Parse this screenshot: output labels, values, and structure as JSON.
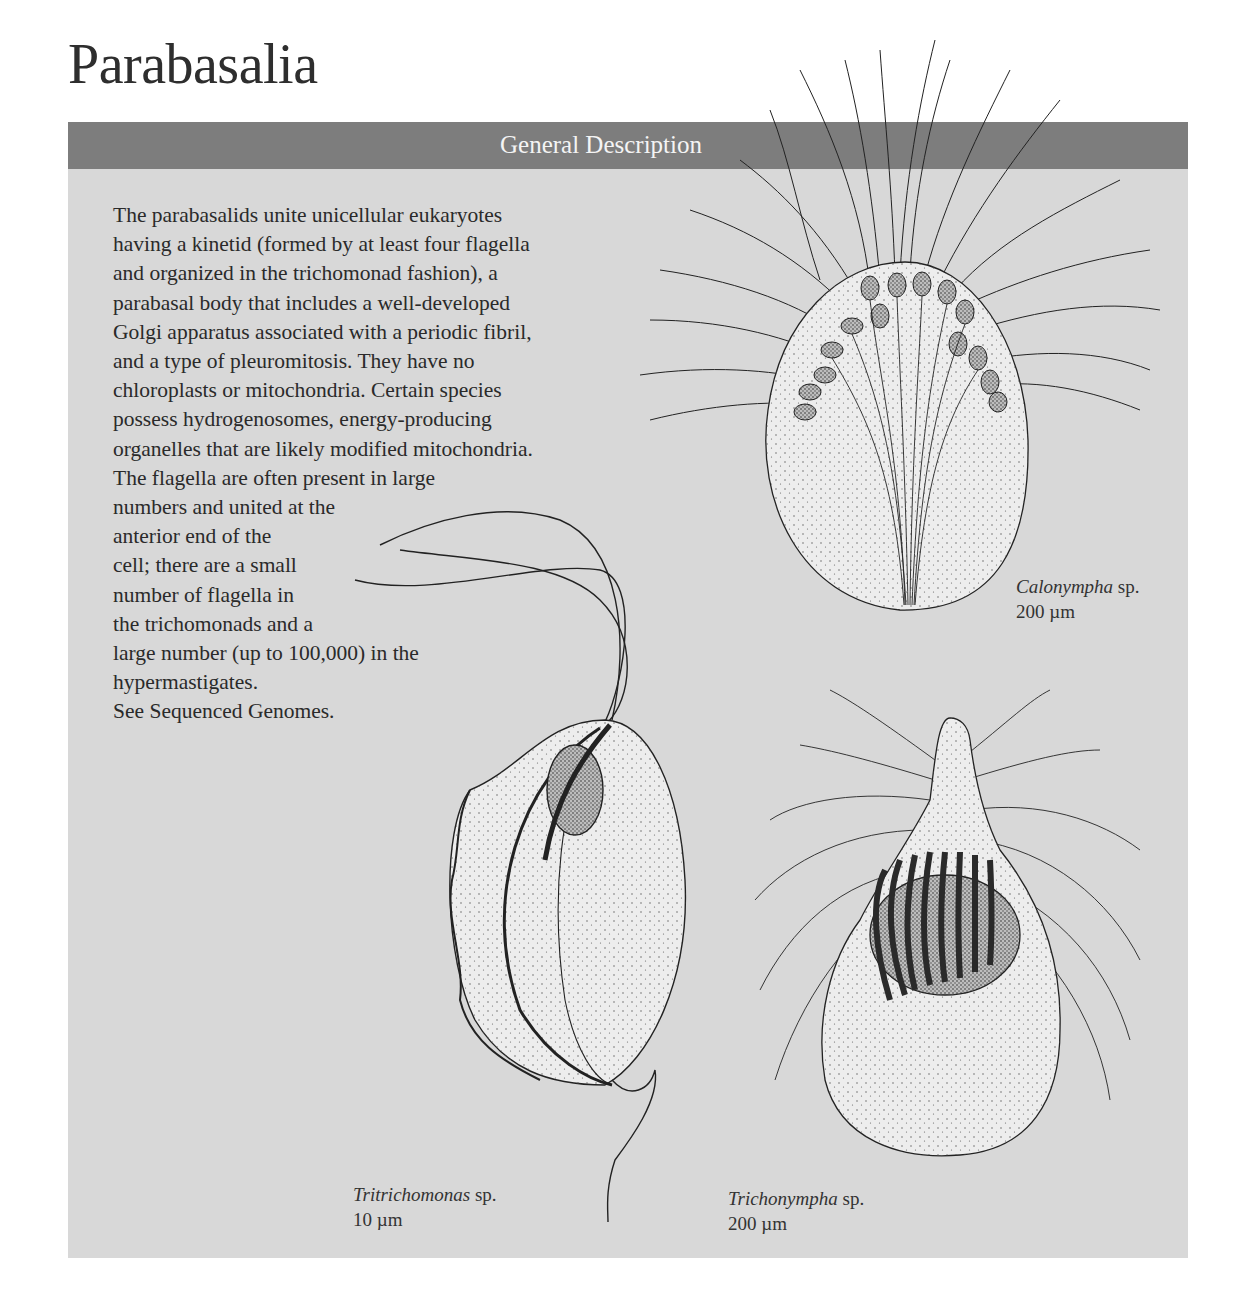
{
  "page": {
    "title": "Parabasalia"
  },
  "panel": {
    "header": "General Description",
    "colors": {
      "header_bg": "#7d7d7d",
      "panel_bg": "#d8d8d8",
      "header_text": "#f4f4f4"
    },
    "description_lines": [
      "The parabasalids unite unicellular eukaryotes",
      "having a kinetid (formed by at least four flagella",
      "and organized in the trichomonad fashion), a",
      "parabasal body that includes a well-developed",
      "Golgi apparatus associated with a periodic fibril,",
      "and a type of pleuromitosis. They have no",
      "chloroplasts or mitochondria. Certain species",
      "possess hydrogenosomes, energy-producing",
      "organelles that are likely modified mitochondria.",
      "The flagella are often present in large",
      "numbers and united at the",
      "anterior end of the",
      "cell; there are a small",
      "number of flagella in",
      "the trichomonads and a",
      "large number (up to 100,000) in the",
      "hypermastigates.",
      "See Sequenced Genomes."
    ]
  },
  "figures": [
    {
      "genus": "Calonympha",
      "suffix": " sp.",
      "scale": "200 µm"
    },
    {
      "genus": "Tritrichomonas",
      "suffix": " sp.",
      "scale": "10 µm"
    },
    {
      "genus": "Trichonympha",
      "suffix": " sp.",
      "scale": "200 µm"
    }
  ]
}
